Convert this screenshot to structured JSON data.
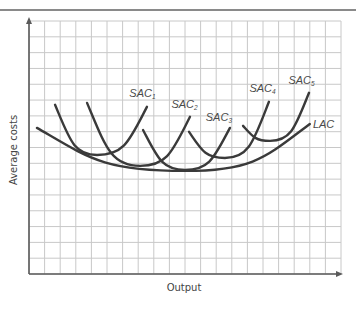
{
  "chart_data": {
    "type": "line",
    "title": "",
    "xlabel": "Output",
    "ylabel": "Average costs",
    "xlim": [
      0,
      20
    ],
    "ylim": [
      0,
      16
    ],
    "grid": true,
    "x_ticks": [],
    "y_ticks": [],
    "series": [
      {
        "name": "LAC",
        "label": "LAC",
        "sub": "",
        "points": [
          [
            0.51,
            9.24
          ],
          [
            10.0,
            6.52
          ],
          [
            18.0,
            9.49
          ]
        ]
      },
      {
        "name": "SAC1",
        "label": "SAC",
        "sub": "1",
        "points": [
          [
            1.67,
            10.7
          ],
          [
            4.36,
            7.53
          ],
          [
            7.56,
            10.57
          ]
        ]
      },
      {
        "name": "SAC2",
        "label": "SAC",
        "sub": "2",
        "points": [
          [
            3.72,
            10.82
          ],
          [
            7.12,
            6.84
          ],
          [
            10.32,
            9.94
          ]
        ]
      },
      {
        "name": "SAC3",
        "label": "SAC",
        "sub": "3",
        "points": [
          [
            7.31,
            9.11
          ],
          [
            10.0,
            6.58
          ],
          [
            12.88,
            9.24
          ]
        ]
      },
      {
        "name": "SAC4",
        "label": "SAC",
        "sub": "4",
        "points": [
          [
            10.26,
            8.99
          ],
          [
            12.56,
            7.34
          ],
          [
            15.38,
            10.89
          ]
        ]
      },
      {
        "name": "SAC5",
        "label": "SAC",
        "sub": "5",
        "points": [
          [
            13.72,
            9.37
          ],
          [
            15.45,
            8.42
          ],
          [
            17.95,
            11.46
          ]
        ]
      }
    ],
    "annotations": [
      {
        "text": "SAC",
        "sub": "1",
        "x": 7.2,
        "y": 11.2
      },
      {
        "text": "SAC",
        "sub": "2",
        "x": 9.9,
        "y": 10.5
      },
      {
        "text": "SAC",
        "sub": "3",
        "x": 12.1,
        "y": 9.65
      },
      {
        "text": "SAC",
        "sub": "4",
        "x": 14.9,
        "y": 11.5
      },
      {
        "text": "SAC",
        "sub": "5",
        "x": 17.4,
        "y": 12.0
      },
      {
        "text": "LAC",
        "sub": "",
        "x": 18.2,
        "y": 9.25
      }
    ]
  }
}
